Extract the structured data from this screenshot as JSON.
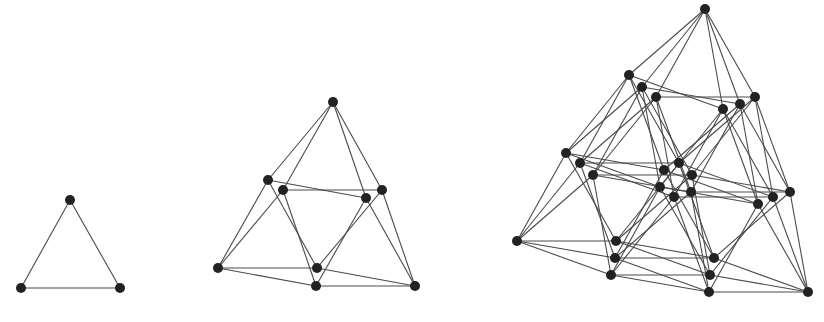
{
  "figure": {
    "style": {
      "edge_color": "#4a4a4a",
      "node_color": "#222222",
      "node_radius": 5,
      "background": "#ffffff"
    },
    "graphs": [
      {
        "name": "graph-level-1",
        "dimension": 1,
        "origin": [
          70,
          200
        ],
        "offsets": [
          [
            [
              0,
              0
            ],
            [
              -49,
              88
            ],
            [
              50,
              88
            ]
          ]
        ]
      },
      {
        "name": "graph-level-2",
        "dimension": 2,
        "origin": [
          333,
          102
        ],
        "offsets": [
          [
            [
              0,
              0
            ],
            [
              -50,
              88
            ],
            [
              49,
              88
            ]
          ],
          [
            [
              0,
              0
            ],
            [
              -65,
              78
            ],
            [
              33,
              96
            ]
          ]
        ]
      },
      {
        "name": "graph-level-3",
        "dimension": 3,
        "origin": [
          705,
          9
        ],
        "offsets": [
          [
            [
              0,
              0
            ],
            [
              -76,
              66
            ],
            [
              18,
              100
            ]
          ],
          [
            [
              0,
              0
            ],
            [
              -63,
              78
            ],
            [
              35,
              95
            ]
          ],
          [
            [
              0,
              0
            ],
            [
              -49,
              88
            ],
            [
              50,
              88
            ]
          ]
        ]
      }
    ]
  }
}
